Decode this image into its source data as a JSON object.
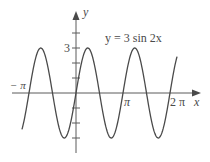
{
  "chart_data": {
    "type": "line",
    "title": "y = 3 sin 2x",
    "equation": "y = 3 sin 2x",
    "xlabel": "x",
    "ylabel": "y",
    "x_tick_labels": [
      "−π",
      "π",
      "2π"
    ],
    "y_tick_labels": [
      "3"
    ],
    "y_ticks": [
      -3,
      -2,
      -1,
      1,
      2,
      3,
      4
    ],
    "xlim_pi": [
      -1.15,
      2.15
    ],
    "ylim": [
      -3,
      3
    ],
    "amplitude": 3,
    "period": "π",
    "series": [
      {
        "name": "y = 3 sin 2x",
        "x": [
          "-π",
          "-3π/4",
          "-π/2",
          "-π/4",
          "0",
          "π/4",
          "π/2",
          "3π/4",
          "π",
          "5π/4",
          "3π/2",
          "7π/4",
          "2π"
        ],
        "values": [
          0,
          3,
          0,
          -3,
          0,
          3,
          0,
          -3,
          0,
          3,
          0,
          -3,
          0
        ]
      }
    ],
    "grid": false,
    "legend": "none"
  },
  "labels": {
    "equation": "y = 3 sin 2x",
    "x_axis": "x",
    "y_axis": "y",
    "neg_pi": "− π",
    "pi": "π",
    "two_pi": "2 π",
    "three": "3"
  },
  "colors": {
    "curve": "#4a4a4a",
    "axis": "#5a5a5a",
    "background": "#ffffff"
  }
}
